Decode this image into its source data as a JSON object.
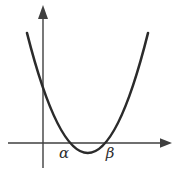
{
  "figure": {
    "labels": {
      "alpha": "α",
      "beta": "β"
    },
    "colors": {
      "curve": "#2b2b2b",
      "axis": "#3f3f3f",
      "label": "#2e2e2e",
      "background": "#ffffff"
    }
  }
}
